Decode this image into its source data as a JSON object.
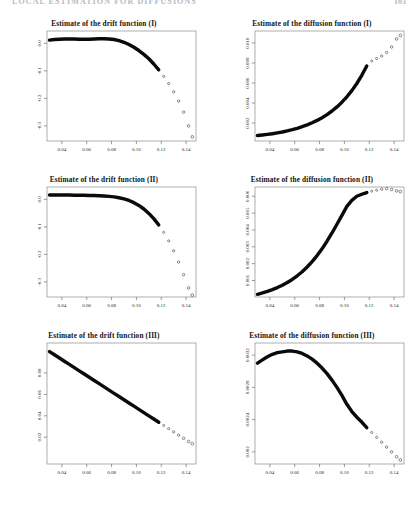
{
  "running_head": {
    "title": "LOCAL ESTIMATION FOR DIFFUSIONS",
    "page": "103"
  },
  "figure": {
    "panels": [
      {
        "id": "drift-1",
        "title": "Estimate of the drift function (I)",
        "row": 1,
        "col": 1
      },
      {
        "id": "diffusion-1",
        "title": "Estimate of the diffusion function (I)",
        "row": 1,
        "col": 2
      },
      {
        "id": "drift-2",
        "title": "Estimate of the drift function (II)",
        "row": 2,
        "col": 1
      },
      {
        "id": "diffusion-2",
        "title": "Estimate of the diffusion function (II)",
        "row": 2,
        "col": 2
      },
      {
        "id": "drift-3",
        "title": "Estimate of the drift function (III)",
        "row": 3,
        "col": 1
      },
      {
        "id": "diffusion-3",
        "title": "Estimate of the diffusion function (III)",
        "row": 3,
        "col": 2
      }
    ]
  },
  "chart_data": [
    {
      "type": "scatter",
      "id": "drift-1",
      "title": "Estimate of the drift function (I)",
      "xlabel": "",
      "ylabel": "",
      "xlim": [
        0.028,
        0.148
      ],
      "ylim": [
        -0.355,
        0.045
      ],
      "xticks": [
        0.04,
        0.06,
        0.08,
        0.1,
        0.12,
        0.14
      ],
      "xticklabels": [
        "0.04",
        "0.06",
        "0.08",
        "0.10",
        "0.12",
        "0.14"
      ],
      "yticks": [
        0.0,
        -0.1,
        -0.2,
        -0.3
      ],
      "yticklabels": [
        "0.0",
        "-0.1",
        "-0.2",
        "-0.3"
      ],
      "grid": false,
      "legend": null,
      "x": [
        0.03,
        0.034,
        0.038,
        0.042,
        0.046,
        0.05,
        0.054,
        0.058,
        0.062,
        0.066,
        0.07,
        0.074,
        0.078,
        0.082,
        0.086,
        0.09,
        0.094,
        0.098,
        0.102,
        0.106,
        0.11,
        0.114,
        0.118,
        0.122,
        0.126,
        0.13,
        0.134,
        0.138,
        0.142,
        0.145
      ],
      "y": [
        0.012,
        0.014,
        0.015,
        0.016,
        0.016,
        0.016,
        0.015,
        0.015,
        0.015,
        0.016,
        0.017,
        0.017,
        0.016,
        0.014,
        0.01,
        0.004,
        -0.004,
        -0.014,
        -0.026,
        -0.04,
        -0.056,
        -0.075,
        -0.096,
        -0.12,
        -0.146,
        -0.176,
        -0.21,
        -0.25,
        -0.3,
        -0.34
      ]
    },
    {
      "type": "scatter",
      "id": "diffusion-1",
      "title": "Estimate of the diffusion function (I)",
      "xlabel": "",
      "ylabel": "",
      "xlim": [
        0.028,
        0.148
      ],
      "ylim": [
        0.0002,
        0.0112
      ],
      "xticks": [
        0.04,
        0.06,
        0.08,
        0.1,
        0.12,
        0.14
      ],
      "xticklabels": [
        "0.04",
        "0.06",
        "0.08",
        "0.10",
        "0.12",
        "0.14"
      ],
      "yticks": [
        0.002,
        0.004,
        0.006,
        0.008,
        0.01
      ],
      "yticklabels": [
        "0.002",
        "0.004",
        "0.006",
        "0.008",
        "0.010"
      ],
      "grid": false,
      "legend": null,
      "x": [
        0.03,
        0.034,
        0.038,
        0.042,
        0.046,
        0.05,
        0.054,
        0.058,
        0.062,
        0.066,
        0.07,
        0.074,
        0.078,
        0.082,
        0.086,
        0.09,
        0.094,
        0.098,
        0.102,
        0.106,
        0.11,
        0.114,
        0.118,
        0.122,
        0.126,
        0.13,
        0.134,
        0.138,
        0.142,
        0.145
      ],
      "y": [
        0.00075,
        0.0008,
        0.00086,
        0.00093,
        0.00101,
        0.0011,
        0.00121,
        0.00133,
        0.00147,
        0.00163,
        0.00181,
        0.00202,
        0.00226,
        0.00253,
        0.00284,
        0.0032,
        0.00361,
        0.00408,
        0.00462,
        0.00524,
        0.00595,
        0.00677,
        0.0077,
        0.0082,
        0.00845,
        0.0087,
        0.00905,
        0.0096,
        0.0104,
        0.01075
      ]
    },
    {
      "type": "scatter",
      "id": "drift-2",
      "title": "Estimate of the drift function (II)",
      "xlabel": "",
      "ylabel": "",
      "xlim": [
        0.028,
        0.148
      ],
      "ylim": [
        -0.355,
        0.045
      ],
      "xticks": [
        0.04,
        0.06,
        0.08,
        0.1,
        0.12,
        0.14
      ],
      "xticklabels": [
        "0.04",
        "0.06",
        "0.08",
        "0.10",
        "0.12",
        "0.14"
      ],
      "yticks": [
        0.0,
        -0.1,
        -0.2,
        -0.3
      ],
      "yticklabels": [
        "0.0",
        "-0.1",
        "-0.2",
        "-0.3"
      ],
      "grid": false,
      "legend": null,
      "x": [
        0.03,
        0.034,
        0.038,
        0.042,
        0.046,
        0.05,
        0.054,
        0.058,
        0.062,
        0.066,
        0.07,
        0.074,
        0.078,
        0.082,
        0.086,
        0.09,
        0.094,
        0.098,
        0.102,
        0.106,
        0.11,
        0.114,
        0.118,
        0.122,
        0.126,
        0.13,
        0.134,
        0.138,
        0.142,
        0.145
      ],
      "y": [
        0.016,
        0.016,
        0.016,
        0.016,
        0.016,
        0.015,
        0.015,
        0.015,
        0.014,
        0.014,
        0.013,
        0.012,
        0.011,
        0.009,
        0.006,
        0.002,
        -0.004,
        -0.012,
        -0.022,
        -0.035,
        -0.051,
        -0.07,
        -0.093,
        -0.12,
        -0.151,
        -0.187,
        -0.228,
        -0.274,
        -0.322,
        -0.348
      ]
    },
    {
      "type": "scatter",
      "id": "diffusion-2",
      "title": "Estimate of the diffusion function (II)",
      "xlabel": "",
      "ylabel": "",
      "xlim": [
        0.028,
        0.148
      ],
      "ylim": [
        2e-05,
        0.00655
      ],
      "xticks": [
        0.04,
        0.06,
        0.08,
        0.1,
        0.12,
        0.14
      ],
      "xticklabels": [
        "0.04",
        "0.06",
        "0.08",
        "0.10",
        "0.12",
        "0.14"
      ],
      "yticks": [
        0.001,
        0.002,
        0.003,
        0.004,
        0.005,
        0.006
      ],
      "yticklabels": [
        "0.001",
        "0.002",
        "0.003",
        "0.004",
        "0.005",
        "0.006"
      ],
      "grid": false,
      "legend": null,
      "x": [
        0.03,
        0.034,
        0.038,
        0.042,
        0.046,
        0.05,
        0.054,
        0.058,
        0.062,
        0.066,
        0.07,
        0.074,
        0.078,
        0.082,
        0.086,
        0.09,
        0.094,
        0.098,
        0.102,
        0.106,
        0.11,
        0.114,
        0.118,
        0.122,
        0.126,
        0.13,
        0.134,
        0.138,
        0.142,
        0.145
      ],
      "y": [
        0.00018,
        0.00026,
        0.00035,
        0.00046,
        0.00058,
        0.00072,
        0.00088,
        0.00106,
        0.00128,
        0.00152,
        0.0018,
        0.00212,
        0.00248,
        0.00288,
        0.00333,
        0.00382,
        0.00434,
        0.00487,
        0.0054,
        0.00576,
        0.006,
        0.00612,
        0.00622,
        0.0063,
        0.00636,
        0.00642,
        0.00645,
        0.0064,
        0.00632,
        0.00628
      ]
    },
    {
      "type": "scatter",
      "id": "drift-3",
      "title": "Estimate of the drift function (III)",
      "xlabel": "",
      "ylabel": "",
      "xlim": [
        0.028,
        0.148
      ],
      "ylim": [
        -0.005,
        0.108
      ],
      "xticks": [
        0.04,
        0.06,
        0.08,
        0.1,
        0.12,
        0.14
      ],
      "xticklabels": [
        "0.04",
        "0.06",
        "0.08",
        "0.10",
        "0.12",
        "0.14"
      ],
      "yticks": [
        0.02,
        0.04,
        0.06,
        0.08
      ],
      "yticklabels": [
        "0.02",
        "0.04",
        "0.06",
        "0.08"
      ],
      "grid": false,
      "legend": null,
      "x": [
        0.03,
        0.034,
        0.038,
        0.042,
        0.046,
        0.05,
        0.054,
        0.058,
        0.062,
        0.066,
        0.07,
        0.074,
        0.078,
        0.082,
        0.086,
        0.09,
        0.094,
        0.098,
        0.102,
        0.106,
        0.11,
        0.114,
        0.118,
        0.122,
        0.126,
        0.13,
        0.134,
        0.138,
        0.142,
        0.145
      ],
      "y": [
        0.1,
        0.097,
        0.094,
        0.091,
        0.088,
        0.085,
        0.082,
        0.079,
        0.076,
        0.073,
        0.07,
        0.067,
        0.064,
        0.061,
        0.058,
        0.055,
        0.052,
        0.049,
        0.046,
        0.043,
        0.04,
        0.037,
        0.034,
        0.031,
        0.028,
        0.025,
        0.022,
        0.019,
        0.016,
        0.014
      ]
    },
    {
      "type": "scatter",
      "id": "diffusion-3",
      "title": "Estimate of the diffusion function (III)",
      "xlabel": "",
      "ylabel": "",
      "xlim": [
        0.028,
        0.148
      ],
      "ylim": [
        0.00185,
        0.00335
      ],
      "xticks": [
        0.04,
        0.06,
        0.08,
        0.1,
        0.12,
        0.14
      ],
      "xticklabels": [
        "0.04",
        "0.06",
        "0.08",
        "0.10",
        "0.12",
        "0.14"
      ],
      "yticks": [
        0.002,
        0.0024,
        0.0028,
        0.0032
      ],
      "yticklabels": [
        "0.002",
        "0.0024",
        "0.0028",
        "0.0032"
      ],
      "grid": false,
      "legend": null,
      "x": [
        0.03,
        0.034,
        0.038,
        0.042,
        0.046,
        0.05,
        0.054,
        0.058,
        0.062,
        0.066,
        0.07,
        0.074,
        0.078,
        0.082,
        0.086,
        0.09,
        0.094,
        0.098,
        0.102,
        0.106,
        0.11,
        0.114,
        0.118,
        0.122,
        0.126,
        0.13,
        0.134,
        0.138,
        0.142,
        0.145
      ],
      "y": [
        0.0031,
        0.00314,
        0.00318,
        0.00321,
        0.00323,
        0.00324,
        0.00325,
        0.00325,
        0.00324,
        0.00322,
        0.00319,
        0.00315,
        0.0031,
        0.00304,
        0.00297,
        0.00289,
        0.0028,
        0.0027,
        0.00259,
        0.0025,
        0.00243,
        0.00237,
        0.0023,
        0.00224,
        0.00218,
        0.00212,
        0.00206,
        0.002,
        0.00194,
        0.0019
      ]
    }
  ]
}
